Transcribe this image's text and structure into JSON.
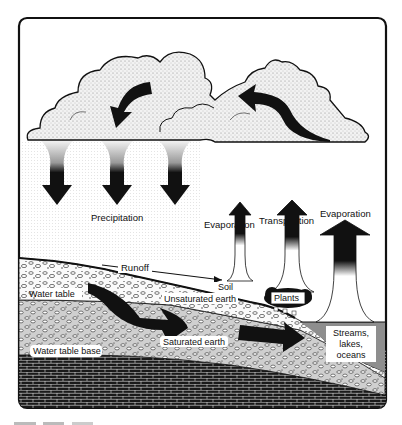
{
  "diagram": {
    "labels": {
      "precipitation": "Precipitation",
      "evaporation_soil": "Evaporation",
      "transpiration": "Transpiration",
      "evaporation_water": "Evaporation",
      "runoff": "Runoff",
      "soil": "Soil",
      "unsaturated_earth": "Unsaturated earth",
      "plants": "Plants",
      "water_table": "Water table",
      "saturated_earth": "Saturated earth",
      "water_table_base": "Water table base",
      "streams_line1": "Streams,",
      "streams_line2": "lakes,",
      "streams_line3": "oceans"
    },
    "caption": ""
  },
  "colors": {
    "ink": "#111111",
    "cloud": "#e6e6e6",
    "rain": "#ececec",
    "water": "#8a8a8a",
    "bedrock": "#1a1a1a"
  }
}
